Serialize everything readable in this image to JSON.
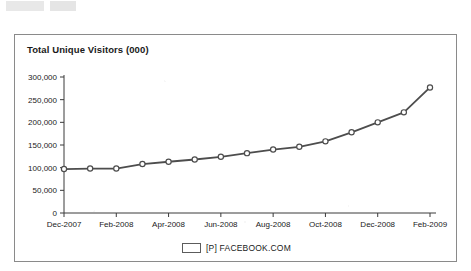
{
  "chart_data": {
    "type": "line",
    "title": "Total Unique Visitors (000)",
    "xlabel": "",
    "ylabel": "",
    "ylim": [
      0,
      300000
    ],
    "ytick_values": [
      0,
      50000,
      100000,
      150000,
      200000,
      250000,
      300000
    ],
    "ytick_labels": [
      "0",
      "50,000",
      "100,000",
      "150,000",
      "200,000",
      "250,000",
      "300,000"
    ],
    "x": [
      "Dec-2007",
      "Jan-2008",
      "Feb-2008",
      "Mar-2008",
      "Apr-2008",
      "May-2008",
      "Jun-2008",
      "Jul-2008",
      "Aug-2008",
      "Sep-2008",
      "Oct-2008",
      "Nov-2008",
      "Dec-2008",
      "Jan-2009",
      "Feb-2009"
    ],
    "xtick_labels": [
      "Dec-2007",
      "Feb-2008",
      "Apr-2008",
      "Jun-2008",
      "Aug-2008",
      "Oct-2008",
      "Dec-2008",
      "Feb-2009"
    ],
    "series": [
      {
        "name": "[P] FACEBOOK.COM",
        "values": [
          97000,
          98000,
          98000,
          108000,
          113000,
          118000,
          124000,
          132000,
          140000,
          146000,
          158000,
          178000,
          200000,
          222000,
          277000
        ],
        "color": "#4d4d4d",
        "marker": "circle"
      }
    ],
    "grid": false,
    "legend_position": "bottom"
  },
  "legend": {
    "label": "[P] FACEBOOK.COM"
  }
}
